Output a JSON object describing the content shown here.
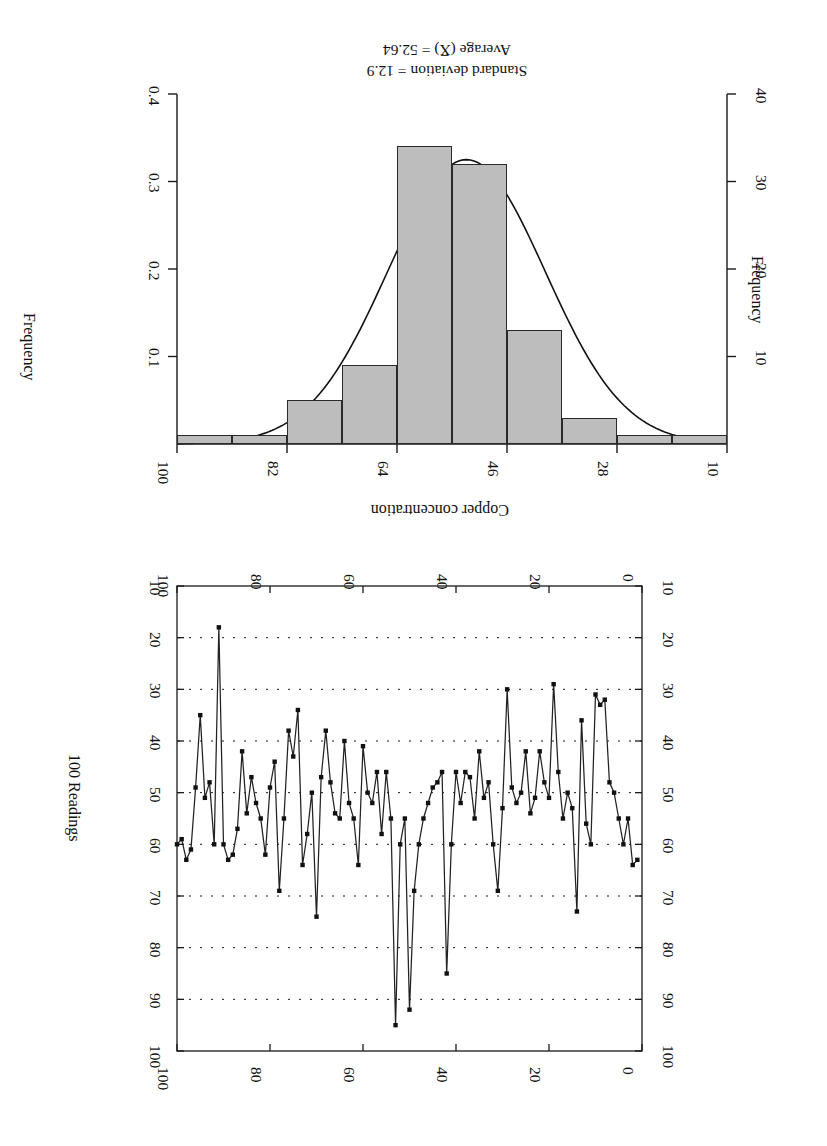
{
  "figure": {
    "orientation": "rotated-180",
    "background": "#ffffff",
    "ink_color": "#1a1a1a",
    "bar_fill": "#bdbdbd"
  },
  "panels": {
    "timeseries": {
      "name": "run-chart",
      "xlabel": "100 Readings",
      "ylabel": "Copper concentration",
      "x_ticks": [
        "0",
        "20",
        "40",
        "60",
        "80",
        "100"
      ],
      "y_ticks_left": [
        "10",
        "20",
        "30",
        "40",
        "50",
        "60",
        "70",
        "80",
        "90",
        "100"
      ],
      "y_ticks_right": [
        "10",
        "20",
        "30",
        "40",
        "50",
        "60",
        "70",
        "80",
        "90",
        "100"
      ]
    },
    "histogram": {
      "name": "histogram",
      "ylabel_left": "Frequency",
      "ylabel_right": "Frequency",
      "x_ticks": [
        "10",
        "28",
        "46",
        "64",
        "82",
        "100"
      ],
      "y_ticks_left": [
        "10",
        "20",
        "30",
        "40"
      ],
      "y_ticks_right": [
        "0.1",
        "0.2",
        "0.3",
        "0.4"
      ],
      "stat_average": "Average (X̅) = 52.64",
      "stat_stdev": "Standard deviation = 12.9"
    }
  },
  "chart_data": [
    {
      "type": "line",
      "name": "copper-concentration-run-chart",
      "title": "",
      "xlabel": "100 Readings",
      "ylabel": "Copper concentration",
      "xlim": [
        0,
        100
      ],
      "ylim": [
        10,
        100
      ],
      "xticks": [
        0,
        20,
        40,
        60,
        80,
        100
      ],
      "yticks": [
        10,
        20,
        30,
        40,
        50,
        60,
        70,
        80,
        90,
        100
      ],
      "grid": "vertical dotted gridlines at every 10 units on y",
      "marker": "filled square",
      "legend": "none",
      "x": [
        1,
        2,
        3,
        4,
        5,
        6,
        7,
        8,
        9,
        10,
        11,
        12,
        13,
        14,
        15,
        16,
        17,
        18,
        19,
        20,
        21,
        22,
        23,
        24,
        25,
        26,
        27,
        28,
        29,
        30,
        31,
        32,
        33,
        34,
        35,
        36,
        37,
        38,
        39,
        40,
        41,
        42,
        43,
        44,
        45,
        46,
        47,
        48,
        49,
        50,
        51,
        52,
        53,
        54,
        55,
        56,
        57,
        58,
        59,
        60,
        61,
        62,
        63,
        64,
        65,
        66,
        67,
        68,
        69,
        70,
        71,
        72,
        73,
        74,
        75,
        76,
        77,
        78,
        79,
        80,
        81,
        82,
        83,
        84,
        85,
        86,
        87,
        88,
        89,
        90,
        91,
        92,
        93,
        94,
        95,
        96,
        97,
        98,
        99,
        100
      ],
      "values": [
        63,
        64,
        55,
        60,
        55,
        50,
        48,
        32,
        33,
        31,
        60,
        56,
        36,
        73,
        53,
        50,
        55,
        46,
        29,
        51,
        48,
        42,
        51,
        54,
        42,
        50,
        52,
        49,
        30,
        53,
        69,
        60,
        48,
        51,
        42,
        55,
        47,
        46,
        52,
        46,
        60,
        85,
        46,
        48,
        49,
        52,
        55,
        60,
        69,
        92,
        55,
        60,
        95,
        55,
        46,
        58,
        46,
        52,
        50,
        41,
        64,
        55,
        52,
        40,
        55,
        54,
        48,
        38,
        47,
        74,
        50,
        58,
        64,
        34,
        43,
        38,
        55,
        69,
        44,
        49,
        62,
        55,
        52,
        47,
        54,
        42,
        57,
        62,
        63,
        60,
        18,
        60,
        48,
        51,
        35,
        49,
        61,
        63,
        59,
        60
      ]
    },
    {
      "type": "bar",
      "name": "copper-concentration-histogram",
      "title": "",
      "xlabel": "",
      "ylabel": "Frequency",
      "xlim": [
        10,
        100
      ],
      "ylim": [
        0,
        40
      ],
      "xticks": [
        10,
        28,
        46,
        64,
        82,
        100
      ],
      "yticks_left": [
        10,
        20,
        30,
        40
      ],
      "yticks_right": [
        0.1,
        0.2,
        0.3,
        0.4
      ],
      "bin_edges": [
        10,
        19,
        28,
        37,
        46,
        55,
        64,
        73,
        82,
        91,
        100
      ],
      "categories": [
        "10-19",
        "19-28",
        "28-37",
        "37-46",
        "46-55",
        "55-64",
        "64-73",
        "73-82",
        "82-91",
        "91-100"
      ],
      "values": [
        1,
        1,
        3,
        13,
        32,
        34,
        9,
        5,
        1,
        1
      ],
      "overlay": {
        "type": "normal-curve",
        "mean": 52.64,
        "stdev": 12.9,
        "peak_frequency": 32.5
      },
      "annotations": [
        "Average (X̅) = 52.64",
        "Standard deviation = 12.9"
      ]
    }
  ]
}
